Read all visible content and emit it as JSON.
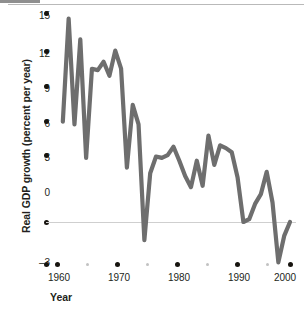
{
  "chart_data": {
    "type": "line",
    "title": "",
    "xlabel": "Year",
    "ylabel": "Real GDP growth (percent per year)",
    "xlim": [
      1960,
      2001
    ],
    "ylim": [
      -3,
      15
    ],
    "grid": false,
    "legend": null,
    "zero_line": 0,
    "line_color": "#6e6e6e",
    "x_ticks": [
      {
        "value": 1960,
        "label": "1960",
        "major": true
      },
      {
        "value": 1965,
        "label": "",
        "major": false
      },
      {
        "value": 1970,
        "label": "1970",
        "major": true
      },
      {
        "value": 1975,
        "label": "",
        "major": false
      },
      {
        "value": 1980,
        "label": "1980",
        "major": true
      },
      {
        "value": 1985,
        "label": "",
        "major": false
      },
      {
        "value": 1990,
        "label": "1990",
        "major": true
      },
      {
        "value": 1995,
        "label": "",
        "major": false
      },
      {
        "value": 2000,
        "label": "2000",
        "major": true
      }
    ],
    "y_ticks": [
      {
        "value": 15,
        "label": "15"
      },
      {
        "value": 12,
        "label": "12"
      },
      {
        "value": 9,
        "label": "9"
      },
      {
        "value": 6,
        "label": "6"
      },
      {
        "value": 3,
        "label": "3"
      },
      {
        "value": 0,
        "label": "0"
      },
      {
        "value": -3,
        "label": "–3"
      }
    ],
    "x": [
      1961,
      1962,
      1963,
      1964,
      1965,
      1966,
      1967,
      1968,
      1969,
      1970,
      1971,
      1972,
      1973,
      1974,
      1975,
      1976,
      1977,
      1978,
      1979,
      1980,
      1981,
      1982,
      1983,
      1984,
      1985,
      1986,
      1987,
      1988,
      1989,
      1990,
      1991,
      1992,
      1993,
      1994,
      1995,
      1996,
      1997,
      1998,
      1999,
      2000
    ],
    "values": [
      7.2,
      14.6,
      7.0,
      13.1,
      4.6,
      11.0,
      10.9,
      11.5,
      10.5,
      12.3,
      11.0,
      3.9,
      8.4,
      7.0,
      -1.3,
      3.5,
      4.7,
      4.6,
      4.8,
      5.4,
      4.4,
      3.3,
      2.5,
      4.4,
      2.6,
      6.2,
      4.1,
      5.5,
      5.3,
      5.0,
      3.2,
      0.0,
      0.2,
      1.3,
      2.0,
      3.6,
      1.4,
      -2.9,
      -1.0,
      0.0
    ],
    "series": [
      {
        "name": "Real GDP growth (percent per year)",
        "values": [
          7.2,
          14.6,
          7.0,
          13.1,
          4.6,
          11.0,
          10.9,
          11.5,
          10.5,
          12.3,
          11.0,
          3.9,
          8.4,
          7.0,
          -1.3,
          3.5,
          4.7,
          4.6,
          4.8,
          5.4,
          4.4,
          3.3,
          2.5,
          4.4,
          2.6,
          6.2,
          4.1,
          5.5,
          5.3,
          5.0,
          3.2,
          0.0,
          0.2,
          1.3,
          2.0,
          3.6,
          1.4,
          -2.9,
          -1.0,
          0.0
        ]
      }
    ]
  },
  "axes": {
    "y_title": "Real GDP growth (percent per year)",
    "x_title": "Year"
  }
}
